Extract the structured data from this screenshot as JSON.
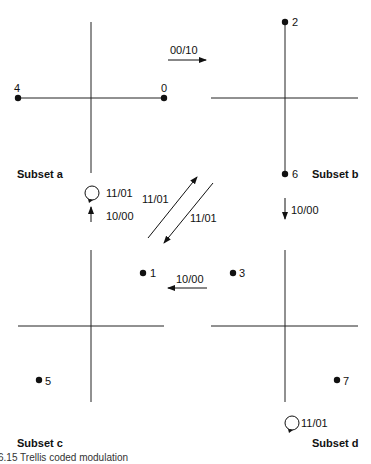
{
  "diagram": {
    "caption": "6.15 Trellis coded modulation",
    "subsets": [
      {
        "name": "Subset a",
        "points": [
          {
            "label": "4"
          },
          {
            "label": "0"
          }
        ],
        "self_loop": "11/01"
      },
      {
        "name": "Subset b",
        "points": [
          {
            "label": "2"
          },
          {
            "label": "6"
          }
        ]
      },
      {
        "name": "Subset c",
        "points": [
          {
            "label": "1"
          },
          {
            "label": "5"
          }
        ]
      },
      {
        "name": "Subset d",
        "points": [
          {
            "label": "3"
          },
          {
            "label": "7"
          }
        ],
        "self_loop": "11/01"
      }
    ],
    "transitions": [
      {
        "from": "Subset a",
        "to": "Subset b",
        "label": "00/10"
      },
      {
        "from": "Subset b",
        "to": "Subset d",
        "label": "10/00"
      },
      {
        "from": "Subset d",
        "to": "Subset c",
        "label": "10/00"
      },
      {
        "from": "Subset c",
        "to": "Subset a",
        "label": "10/00"
      },
      {
        "from": "Subset c",
        "to": "Subset b",
        "label": "11/01"
      },
      {
        "from": "Subset b",
        "to": "Subset c",
        "label": "11/01"
      },
      {
        "from": "Subset a",
        "to": "Subset a",
        "label": "11/01"
      },
      {
        "from": "Subset d",
        "to": "Subset d",
        "label": "11/01"
      }
    ],
    "colors": {
      "ink": "#111111",
      "background": "#ffffff"
    }
  }
}
